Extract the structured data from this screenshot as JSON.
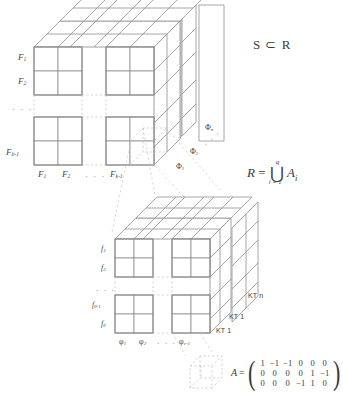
{
  "figure": {
    "line_color": "#8c8c8c",
    "dash_color": "#b9b9b9",
    "text_color": "#3f3f3f"
  },
  "upper_cube": {
    "row_labels": [
      "F₁",
      "F₂",
      "Fₖ₋₁"
    ],
    "row_label_parts": [
      {
        "base": "F",
        "sub": "1"
      },
      {
        "base": "F",
        "sub": "2"
      },
      {
        "base": "F",
        "sub": "b-1"
      }
    ],
    "row_ellipsis": "· · ·",
    "col_label_parts": [
      {
        "base": "F",
        "sub": "1"
      },
      {
        "base": "F",
        "sub": "2"
      },
      {
        "base": "F",
        "sub": "k-1"
      }
    ],
    "col_ellipsis": "· · ·",
    "depth_label_parts": [
      {
        "base": "Φ",
        "sub": "1"
      },
      {
        "base": "Φ",
        "sub": "2"
      },
      {
        "base": "Φ",
        "sub": "n"
      }
    ],
    "depth_ellipsis": "· · ·"
  },
  "lower_cube": {
    "row_label_parts": [
      {
        "base": "f",
        "sub": "1"
      },
      {
        "base": "f",
        "sub": "2"
      },
      {
        "base": "f",
        "sub": "θ-1"
      },
      {
        "base": "f",
        "sub": "θ"
      }
    ],
    "row_ellipsis": "· · ·",
    "col_label_parts": [
      {
        "base": "φ",
        "sub": "1"
      },
      {
        "base": "φ",
        "sub": "2"
      },
      {
        "base": "φ",
        "sub": "v-1"
      }
    ],
    "col_ellipsis": "· · ·",
    "kt_labels": [
      "KT 1",
      "KT 1",
      "KT n"
    ]
  },
  "equations": {
    "subset": {
      "left": "S",
      "relation": "⊂",
      "right": "R"
    },
    "union": {
      "lhs": "R",
      "eq": "=",
      "operator": "⋃",
      "upper_limit": "q",
      "lower_limit": "i = 1",
      "operand_base": "A",
      "operand_sub": "i"
    },
    "matrix": {
      "name": "A",
      "eq": "=",
      "rows": [
        [
          "1",
          "−1",
          "−1",
          "0",
          "0",
          "0"
        ],
        [
          "0",
          "0",
          "0",
          "0",
          "1",
          "−1"
        ],
        [
          "0",
          "0",
          "0",
          "−1",
          "1",
          "0"
        ]
      ]
    }
  }
}
